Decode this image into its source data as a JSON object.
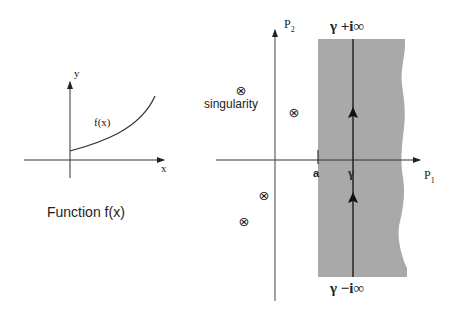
{
  "left_panel": {
    "caption": "Function f(x)",
    "x_axis_label": "x",
    "y_axis_label": "y",
    "curve_label": "f(x)"
  },
  "right_panel": {
    "horizontal_axis_label": "P",
    "horizontal_axis_subscript": "1",
    "vertical_axis_label": "P",
    "vertical_axis_subscript": "2",
    "top_limit_label": "γ +i∞",
    "bottom_limit_label": "γ −i∞",
    "contour_point_label": "γ",
    "abscissa_label": "a",
    "singularity_label": "singularity",
    "singularity_symbol": "⊗",
    "region_color": "#a9a9a9"
  }
}
